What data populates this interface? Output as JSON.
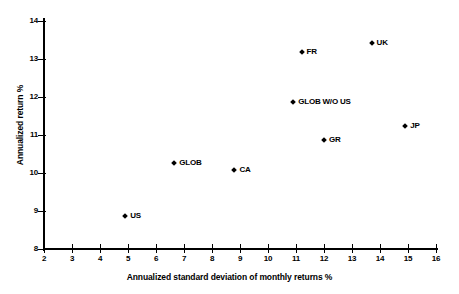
{
  "chart_data": {
    "type": "scatter",
    "title": "",
    "xlabel": "Annualized standard deviation of monthly returns %",
    "ylabel": "Annualized return %",
    "xlim": [
      2,
      16
    ],
    "ylim": [
      8,
      14
    ],
    "xticks": [
      "2",
      "3",
      "4",
      "5",
      "6",
      "7",
      "8",
      "9",
      "10",
      "11",
      "12",
      "13",
      "14",
      "15",
      "16"
    ],
    "yticks": [
      "8",
      "9",
      "10",
      "11",
      "12",
      "13",
      "14"
    ],
    "grid": false,
    "legend": "none",
    "marker_color": "#000000",
    "points": [
      {
        "label": "US",
        "x": 4.9,
        "y": 9.0,
        "label_pos": "right"
      },
      {
        "label": "GLOB",
        "x": 6.65,
        "y": 10.4,
        "label_pos": "right"
      },
      {
        "label": "CA",
        "x": 8.8,
        "y": 10.2,
        "label_pos": "right"
      },
      {
        "label": "GLOB W/O US",
        "x": 10.9,
        "y": 12.0,
        "label_pos": "right"
      },
      {
        "label": "FR",
        "x": 11.2,
        "y": 13.3,
        "label_pos": "right"
      },
      {
        "label": "GR",
        "x": 12.0,
        "y": 11.0,
        "label_pos": "right"
      },
      {
        "label": "UK",
        "x": 13.7,
        "y": 13.55,
        "label_pos": "right"
      },
      {
        "label": "JP",
        "x": 14.9,
        "y": 11.35,
        "label_pos": "right"
      }
    ]
  }
}
